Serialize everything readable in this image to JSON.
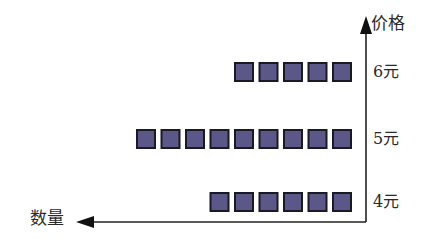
{
  "chart_data": {
    "type": "bar",
    "subtype": "pictogram-horizontal",
    "title": "",
    "xlabel": "数量",
    "ylabel": "价格",
    "categories": [
      "4元",
      "5元",
      "6元"
    ],
    "values": [
      6,
      9,
      5
    ],
    "unit_symbol": "square",
    "orientation": "horizontal, growing leftward from vertical axis on right",
    "grid": false,
    "legend": null,
    "colors": {
      "square_fill": "#5b5789",
      "square_border": "#1a1a22",
      "axis": "#222222"
    }
  },
  "axes": {
    "x_label": "数量",
    "y_label": "价格"
  },
  "rows": [
    {
      "label": "6元",
      "count": 5
    },
    {
      "label": "5元",
      "count": 9
    },
    {
      "label": "4元",
      "count": 6
    }
  ]
}
